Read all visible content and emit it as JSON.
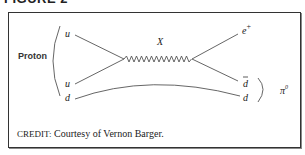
{
  "figure": {
    "title": "FIGURE 2",
    "credit_label": "CREDIT:",
    "credit_text": " Courtesy of Vernon Barger."
  },
  "diagram": {
    "proton_label": "Proton",
    "incoming_quarks": [
      "u",
      "u",
      "d"
    ],
    "mediator_label": "X",
    "outgoing": {
      "positron": "e",
      "positron_sup": "+",
      "antidown": "d",
      "down": "d"
    },
    "meson_label": "π",
    "meson_sup": "0",
    "colors": {
      "line": "#555555",
      "text": "#222222",
      "frame": "#333333"
    }
  }
}
